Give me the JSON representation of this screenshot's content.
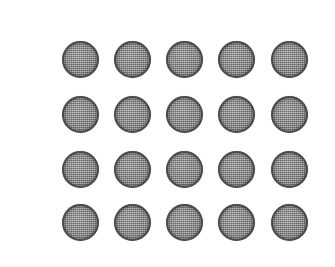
{
  "scene": {
    "title": "Grid of circular discs",
    "description": "Twenty gray textured circular discs arranged in a 5 by 4 grid on a white background",
    "width": 335,
    "height": 267,
    "background_color": "#ffffff"
  },
  "grid": {
    "columns": 5,
    "rows": 4,
    "count": 20,
    "column_centers_x": [
      80,
      132,
      184,
      236,
      289
    ],
    "row_centers_y": [
      59,
      114,
      169,
      222
    ],
    "disc_diameter": 37
  },
  "disc_style": {
    "fill_color": "#8a8a8a",
    "edge_color": "#4a4a4a",
    "texture": "halftone-dither",
    "shape": "circle"
  },
  "discs": [
    {
      "id": "disc-r1-c1",
      "row": 1,
      "col": 1,
      "cx": 80,
      "cy": 59,
      "d": 37
    },
    {
      "id": "disc-r1-c2",
      "row": 1,
      "col": 2,
      "cx": 132,
      "cy": 59,
      "d": 37
    },
    {
      "id": "disc-r1-c3",
      "row": 1,
      "col": 3,
      "cx": 184,
      "cy": 59,
      "d": 37
    },
    {
      "id": "disc-r1-c4",
      "row": 1,
      "col": 4,
      "cx": 236,
      "cy": 59,
      "d": 37
    },
    {
      "id": "disc-r1-c5",
      "row": 1,
      "col": 5,
      "cx": 289,
      "cy": 59,
      "d": 37
    },
    {
      "id": "disc-r2-c1",
      "row": 2,
      "col": 1,
      "cx": 80,
      "cy": 114,
      "d": 37
    },
    {
      "id": "disc-r2-c2",
      "row": 2,
      "col": 2,
      "cx": 132,
      "cy": 114,
      "d": 37
    },
    {
      "id": "disc-r2-c3",
      "row": 2,
      "col": 3,
      "cx": 184,
      "cy": 114,
      "d": 37
    },
    {
      "id": "disc-r2-c4",
      "row": 2,
      "col": 4,
      "cx": 236,
      "cy": 114,
      "d": 37
    },
    {
      "id": "disc-r2-c5",
      "row": 2,
      "col": 5,
      "cx": 289,
      "cy": 114,
      "d": 37
    },
    {
      "id": "disc-r3-c1",
      "row": 3,
      "col": 1,
      "cx": 80,
      "cy": 169,
      "d": 37
    },
    {
      "id": "disc-r3-c2",
      "row": 3,
      "col": 2,
      "cx": 132,
      "cy": 169,
      "d": 37
    },
    {
      "id": "disc-r3-c3",
      "row": 3,
      "col": 3,
      "cx": 184,
      "cy": 169,
      "d": 37
    },
    {
      "id": "disc-r3-c4",
      "row": 3,
      "col": 4,
      "cx": 236,
      "cy": 169,
      "d": 37
    },
    {
      "id": "disc-r3-c5",
      "row": 3,
      "col": 5,
      "cx": 289,
      "cy": 169,
      "d": 37
    },
    {
      "id": "disc-r4-c1",
      "row": 4,
      "col": 1,
      "cx": 80,
      "cy": 222,
      "d": 37
    },
    {
      "id": "disc-r4-c2",
      "row": 4,
      "col": 2,
      "cx": 132,
      "cy": 222,
      "d": 37
    },
    {
      "id": "disc-r4-c3",
      "row": 4,
      "col": 3,
      "cx": 184,
      "cy": 222,
      "d": 37
    },
    {
      "id": "disc-r4-c4",
      "row": 4,
      "col": 4,
      "cx": 236,
      "cy": 222,
      "d": 37
    },
    {
      "id": "disc-r4-c5",
      "row": 4,
      "col": 5,
      "cx": 289,
      "cy": 222,
      "d": 37
    }
  ]
}
